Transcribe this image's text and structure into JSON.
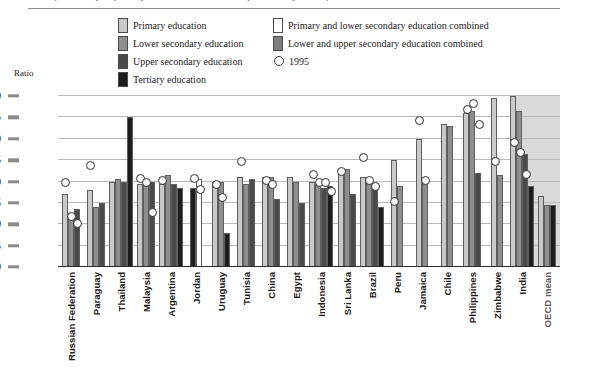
{
  "figure": {
    "cut_title": "ratio of secondary to primary teachers' salaries and expenditure by level of education",
    "ratio_label": "Ratio"
  },
  "legend": {
    "left": [
      {
        "key": "primary",
        "label": "Primary education",
        "swatch": "pri",
        "color": "#c9c9c9"
      },
      {
        "key": "lower_secondary",
        "label": "Lower secondary education",
        "swatch": "low",
        "color": "#8e8e8e"
      },
      {
        "key": "upper_secondary",
        "label": "Upper secondary education",
        "swatch": "upp",
        "color": "#4a4a4a"
      },
      {
        "key": "tertiary",
        "label": "Tertiary education",
        "swatch": "ter",
        "color": "#1d1d1d"
      }
    ],
    "right": [
      {
        "key": "primary_lower_combined",
        "label": "Primary and lower secondary education combined",
        "swatch": "plc",
        "color": "#ffffff"
      },
      {
        "key": "lower_upper_combined",
        "label": "Lower and upper secondary education combined",
        "swatch": "luc",
        "color": "#7e7e7e"
      },
      {
        "key": "marker_1995",
        "label": "1995",
        "swatch": "circle",
        "color": "#ffffff"
      }
    ]
  },
  "chart_data": {
    "type": "bar",
    "title": "",
    "xlabel": "",
    "ylabel": "Ratio",
    "ylim": [
      0,
      40
    ],
    "yticks": [
      0,
      5,
      10,
      15,
      20,
      25,
      30,
      35,
      40
    ],
    "ytick_labels": [
      "0",
      "5",
      "10",
      "15",
      "20",
      "25",
      "30",
      "35",
      "40"
    ],
    "grid": true,
    "legend_position": "top",
    "highlight_band": "OECD mean",
    "categories": [
      "Russian Federation",
      "Paraguay",
      "Thailand",
      "Malaysia",
      "Argentina",
      "Jordan",
      "Uruguay",
      "Tunisia",
      "China",
      "Egypt",
      "Indonesia",
      "Sri Lanka",
      "Brazil",
      "Peru",
      "Jamaica",
      "Chile",
      "Philippines",
      "Zimbabwe",
      "India",
      "OECD mean"
    ],
    "series": [
      {
        "name": "Primary education",
        "style": "pri",
        "values": [
          17,
          18,
          20,
          19.5,
          19.5,
          null,
          20,
          21,
          21,
          21,
          20,
          23,
          21,
          25,
          30,
          33.5,
          36,
          39.5,
          40,
          16.5
        ]
      },
      {
        "name": "Lower secondary education",
        "style": "low",
        "values": [
          12,
          14,
          20.5,
          19.5,
          21.5,
          null,
          20,
          19.5,
          21,
          20,
          19.5,
          23,
          20,
          19,
          20,
          33,
          36.5,
          21.5,
          36.5,
          14.5
        ]
      },
      {
        "name": "Upper secondary education",
        "style": "upp",
        "values": [
          13.5,
          15,
          20,
          20,
          19.5,
          null,
          null,
          20.5,
          16,
          15,
          18.5,
          17,
          18,
          null,
          null,
          null,
          22,
          null,
          26.5,
          null
        ]
      },
      {
        "name": "Tertiary education",
        "style": "ter",
        "values": [
          null,
          null,
          35,
          null,
          18.5,
          18.5,
          8,
          null,
          null,
          null,
          19,
          null,
          14,
          null,
          null,
          null,
          null,
          null,
          19,
          14.5
        ]
      },
      {
        "name": "Primary and lower secondary education combined",
        "style": "plc",
        "values": [
          null,
          null,
          null,
          null,
          null,
          20.5,
          null,
          null,
          null,
          null,
          null,
          null,
          null,
          null,
          null,
          null,
          null,
          null,
          null,
          null
        ]
      },
      {
        "name": "Lower and upper secondary education combined",
        "style": "luc",
        "values": [
          null,
          null,
          null,
          null,
          null,
          null,
          null,
          null,
          null,
          null,
          null,
          null,
          null,
          null,
          null,
          null,
          null,
          null,
          null,
          null
        ]
      }
    ],
    "marker_1995": {
      "name": "1995",
      "points": [
        {
          "category": "Russian Federation",
          "values": [
            19.5,
            11.5,
            10
          ]
        },
        {
          "category": "Paraguay",
          "values": [
            23.5
          ]
        },
        {
          "category": "Thailand",
          "values": []
        },
        {
          "category": "Malaysia",
          "values": [
            20.5,
            19.5,
            12.5
          ]
        },
        {
          "category": "Argentina",
          "values": [
            20
          ]
        },
        {
          "category": "Jordan",
          "values": [
            20.5,
            18
          ]
        },
        {
          "category": "Uruguay",
          "values": [
            19,
            16
          ]
        },
        {
          "category": "Tunisia",
          "values": [
            24.5
          ]
        },
        {
          "category": "China",
          "values": [
            20,
            19
          ]
        },
        {
          "category": "Egypt",
          "values": []
        },
        {
          "category": "Indonesia",
          "values": [
            21.5,
            19.5,
            19.5,
            17.5
          ]
        },
        {
          "category": "Sri Lanka",
          "values": [
            22
          ]
        },
        {
          "category": "Brazil",
          "values": [
            25.5,
            20,
            18.5
          ]
        },
        {
          "category": "Peru",
          "values": [
            15
          ]
        },
        {
          "category": "Jamaica",
          "values": [
            34,
            20
          ]
        },
        {
          "category": "Chile",
          "values": []
        },
        {
          "category": "Philippines",
          "values": [
            36.5,
            38,
            33
          ]
        },
        {
          "category": "Zimbabwe",
          "values": [
            24.5
          ]
        },
        {
          "category": "India",
          "values": [
            29,
            26.5,
            21.5
          ]
        },
        {
          "category": "OECD mean",
          "values": []
        }
      ]
    }
  }
}
